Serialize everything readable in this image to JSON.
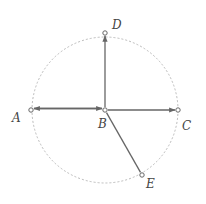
{
  "diagram": {
    "circle": {
      "cx": 105,
      "cy": 110,
      "r": 73,
      "style": "dotted",
      "color": "#bbbbbb"
    },
    "stroke_color": "#666666",
    "points": [
      {
        "id": "A",
        "label": "A",
        "x": 31,
        "y": 110,
        "label_x": 12,
        "label_y": 122
      },
      {
        "id": "B",
        "label": "B",
        "x": 105,
        "y": 110,
        "label_x": 98,
        "label_y": 128
      },
      {
        "id": "C",
        "label": "C",
        "x": 178,
        "y": 110,
        "label_x": 182,
        "label_y": 130
      },
      {
        "id": "D",
        "label": "D",
        "x": 105,
        "y": 33,
        "label_x": 112,
        "label_y": 29
      },
      {
        "id": "E",
        "label": "E",
        "x": 142,
        "y": 175,
        "label_x": 146,
        "label_y": 188
      }
    ],
    "edges": [
      {
        "from": "A",
        "to": "B",
        "arrow": "B",
        "offset": -1.5
      },
      {
        "from": "B",
        "to": "A",
        "arrow": "A",
        "offset": 1.5
      },
      {
        "from": "B",
        "to": "C",
        "arrow": "C"
      },
      {
        "from": "B",
        "to": "D",
        "arrow": "D"
      },
      {
        "from": "B",
        "to": "E",
        "arrow": "none"
      }
    ]
  }
}
